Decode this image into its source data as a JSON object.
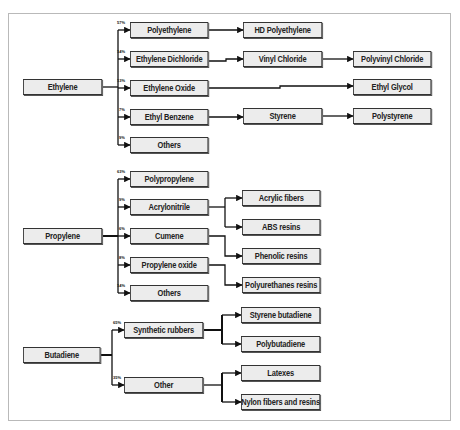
{
  "diagram": {
    "title": "",
    "groups": [
      {
        "root": "Ethylene",
        "children": [
          {
            "label": "Polyethylene",
            "pct": "57%",
            "products": [
              "HD Polyethylene"
            ]
          },
          {
            "label": "Ethylene Dichloride",
            "pct": "14%",
            "products": [
              "Vinyl Chloride",
              "Polyvinyl Chloride"
            ]
          },
          {
            "label": "Ethylene Oxide",
            "pct": "13%",
            "products": [
              "Ethyl Glycol"
            ]
          },
          {
            "label": "Ethyl Benzene",
            "pct": "7%",
            "products": [
              "Styrene",
              "Polystyrene"
            ]
          },
          {
            "label": "Others",
            "pct": "9%",
            "products": []
          }
        ]
      },
      {
        "root": "Propylene",
        "children": [
          {
            "label": "Polypropylene",
            "pct": "63%",
            "products": []
          },
          {
            "label": "Acrylonitrile",
            "pct": "9%",
            "products": [
              "Acrylic fibers",
              "ABS resins"
            ]
          },
          {
            "label": "Cumene",
            "pct": "6%",
            "products": [
              "Phenolic resins"
            ]
          },
          {
            "label": "Propylene oxide",
            "pct": "8%",
            "products": [
              "Polyurethanes resins"
            ]
          },
          {
            "label": "Others",
            "pct": "14%",
            "products": []
          }
        ]
      },
      {
        "root": "Butadiene",
        "children": [
          {
            "label": "Synthetic rubbers",
            "pct": "65%",
            "products": [
              "Styrene butadiene",
              "Polybutadiene"
            ]
          },
          {
            "label": "Other",
            "pct": "35%",
            "products": [
              "Latexes",
              "Nylon fibers and resins"
            ]
          }
        ]
      }
    ],
    "colors": {
      "box_fill": "#ececec",
      "box_border": "#333333",
      "line": "#111111",
      "frame": "#b9b9b9"
    }
  }
}
